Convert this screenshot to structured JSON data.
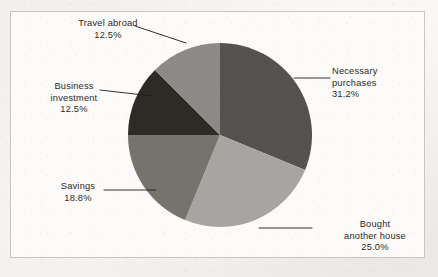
{
  "chart_data": {
    "type": "pie",
    "title": "",
    "subtitle": "",
    "xlabel": "",
    "ylabel": "",
    "legend_position": "none",
    "labels_position": "outside-with-leader-lines",
    "grid": false,
    "start_angle_deg": 0,
    "direction": "clockwise",
    "categories": [
      "Necessary purchases",
      "Bought another house",
      "Savings",
      "Business investment",
      "Travel abroad"
    ],
    "values": [
      31.2,
      25.0,
      18.8,
      12.5,
      12.5
    ],
    "value_labels": [
      "31.2%",
      "25.0%",
      "18.8%",
      "12.5%",
      "12.5%"
    ],
    "units": "percent",
    "total": 100.0,
    "slices": [
      {
        "name": "Necessary purchases",
        "label_line1": "Necessary",
        "label_line2": "purchases",
        "percent": 31.2,
        "percent_text": "31.2%",
        "color": "#55534f",
        "start_deg": 0,
        "end_deg": 112.32
      },
      {
        "name": "Bought another house",
        "label_line1": "Bought",
        "label_line2": "another house",
        "percent": 25.0,
        "percent_text": "25.0%",
        "color": "#a9a7a3",
        "start_deg": 112.32,
        "end_deg": 202.32
      },
      {
        "name": "Savings",
        "label_line1": "Savings",
        "label_line2": "",
        "percent": 18.8,
        "percent_text": "18.8%",
        "color": "#77756f",
        "start_deg": 202.32,
        "end_deg": 270.0
      },
      {
        "name": "Business investment",
        "label_line1": "Business",
        "label_line2": "investment",
        "percent": 12.5,
        "percent_text": "12.5%",
        "color": "#2f2b28",
        "start_deg": 270.0,
        "end_deg": 315.0
      },
      {
        "name": "Travel abroad",
        "label_line1": "Travel abroad",
        "label_line2": "",
        "percent": 12.5,
        "percent_text": "12.5%",
        "color": "#8e8c88",
        "start_deg": 315.0,
        "end_deg": 360.0
      }
    ],
    "colors": {
      "necessary_purchases": "#55534f",
      "bought_another_house": "#a9a7a3",
      "savings": "#77756f",
      "business_investment": "#2f2b28",
      "travel_abroad": "#8e8c88",
      "leader_line": "#1f1d1b",
      "label_text": "#2c2a28",
      "frame_border": "#c9c6c0",
      "plot_background": "#fcfbf9",
      "page_background": "#f7f5f2"
    }
  },
  "labels": {
    "travel": {
      "line1": "Travel abroad",
      "percent": "12.5%"
    },
    "business": {
      "line1": "Business",
      "line2": "investment",
      "percent": "12.5%"
    },
    "savings": {
      "line1": "Savings",
      "percent": "18.8%"
    },
    "necessary": {
      "line1": "Necessary",
      "line2": "purchases",
      "percent": "31.2%"
    },
    "bought": {
      "line1": "Bought",
      "line2": "another house",
      "percent": "25.0%"
    }
  }
}
